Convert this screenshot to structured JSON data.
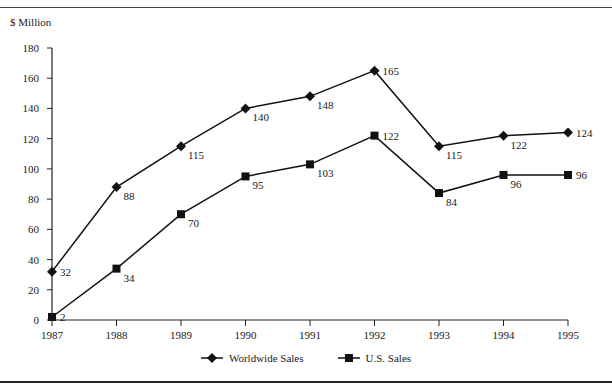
{
  "chart_data": {
    "type": "line",
    "title": "",
    "xlabel": "",
    "ylabel": "$ Million",
    "categories": [
      "1987",
      "1988",
      "1989",
      "1990",
      "1991",
      "1992",
      "1993",
      "1994",
      "1995"
    ],
    "series": [
      {
        "name": "Worldwide Sales",
        "marker": "diamond",
        "values": [
          32,
          88,
          115,
          140,
          148,
          165,
          115,
          122,
          124
        ]
      },
      {
        "name": "U.S. Sales",
        "marker": "square",
        "values": [
          2,
          34,
          70,
          95,
          103,
          122,
          84,
          96,
          96
        ]
      }
    ],
    "ylim": [
      0,
      180
    ],
    "yticks": [
      0,
      20,
      40,
      60,
      80,
      100,
      120,
      140,
      160,
      180
    ],
    "grid": false,
    "legend_position": "bottom",
    "data_labels": true
  },
  "unit_label": "$ Million",
  "legend": [
    {
      "label": "Worldwide Sales",
      "icon": "diamond-marker"
    },
    {
      "label": "U.S. Sales",
      "icon": "square-marker"
    }
  ]
}
